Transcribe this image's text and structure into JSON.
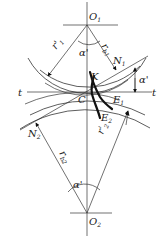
{
  "diagram": {
    "type": "gear meshing geometry",
    "points": {
      "O1": {
        "label": "O",
        "sub": "1"
      },
      "O2": {
        "label": "O",
        "sub": "2"
      },
      "C": {
        "label": "C"
      },
      "K": {
        "label": "K"
      },
      "N1": {
        "label": "N",
        "sub": "1"
      },
      "N2": {
        "label": "N",
        "sub": "2"
      },
      "E1": {
        "label": "E",
        "sub": "1"
      },
      "E2": {
        "label": "E",
        "sub": "2"
      }
    },
    "lines": {
      "t_left": "t",
      "t_right": "t"
    },
    "dimensions": {
      "r1_prime": {
        "label": "r'",
        "sub": "1"
      },
      "r2_prime": {
        "label": "r'",
        "sub": "2"
      },
      "rb1": {
        "label": "r",
        "sub": "b1"
      },
      "rb2": {
        "label": "r",
        "sub": "b2"
      },
      "alpha_top": "α'",
      "alpha_right": "α'",
      "alpha_bottom": "α'"
    },
    "colors": {
      "line": "#333333",
      "background": "#ffffff"
    }
  }
}
